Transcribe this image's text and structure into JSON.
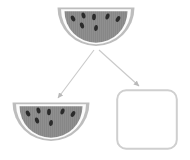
{
  "canvas": {
    "width": 190,
    "height": 160,
    "background": "#ffffff"
  },
  "palette": {
    "flesh": "#878787",
    "flesh_stripe": "#8f8f8f",
    "inner_rind": "#fbfbfb",
    "outer_rind": "#bdbdbd",
    "seed": "#2b2b2b",
    "connector": "#c9c9c9",
    "placeholder_border": "#cfcfcf",
    "placeholder_fill": "#ffffff"
  },
  "diagram": {
    "type": "node-link",
    "title": "",
    "nodes": [
      {
        "id": "source",
        "kind": "watermelon-slice",
        "label": "",
        "x": 56,
        "y": 4,
        "width": 80,
        "height": 48,
        "seed_count": 7
      },
      {
        "id": "result-left",
        "kind": "watermelon-slice",
        "label": "",
        "x": 11,
        "y": 99,
        "width": 80,
        "height": 48,
        "seed_count": 7
      },
      {
        "id": "result-right",
        "kind": "empty-placeholder",
        "label": "",
        "x": 116,
        "y": 89,
        "width": 62,
        "height": 61,
        "corner_radius": 9
      }
    ],
    "edges": [
      {
        "id": "edge-source-to-left",
        "from": "source",
        "to": "result-left",
        "arrowhead": "filled-triangle",
        "x1": 94,
        "y1": 50,
        "x2": 56,
        "y2": 100
      },
      {
        "id": "edge-source-to-right",
        "from": "source",
        "to": "result-right",
        "arrowhead": "filled-triangle",
        "x1": 99,
        "y1": 50,
        "x2": 141,
        "y2": 88
      }
    ]
  },
  "icons": {
    "watermelon_slice": "watermelon-slice-icon",
    "arrow_connector": "arrow-icon",
    "placeholder_box": "empty-box-icon"
  }
}
